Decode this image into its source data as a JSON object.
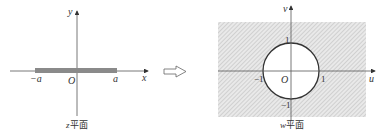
{
  "left_panel": {
    "caption_var": "z",
    "caption_text": "平面",
    "x_axis_label": "x",
    "y_axis_label": "y",
    "origin_label": "O",
    "neg_a_label": "−a",
    "pos_a_label": "a",
    "segment": {
      "from": "-a",
      "to": "a",
      "color": "#888888"
    }
  },
  "arrow": {
    "direction": "right",
    "meaning": "maps-to"
  },
  "right_panel": {
    "caption_var": "w",
    "caption_text": "平面",
    "u_axis_label": "u",
    "v_axis_label": "v",
    "origin_label": "O",
    "tick_labels": {
      "u_neg": "−1",
      "u_pos": "1",
      "v_pos": "1",
      "v_neg": "−1"
    },
    "circle": {
      "center": [
        0,
        0
      ],
      "radius": 1,
      "color": "#333333"
    },
    "shaded_region": "exterior of unit circle (hatched)"
  }
}
